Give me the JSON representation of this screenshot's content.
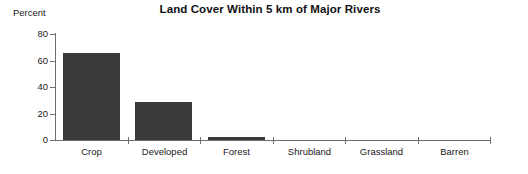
{
  "chart_data": {
    "type": "bar",
    "title": "Land Cover Within 5 km of Major Rivers",
    "xlabel": "",
    "ylabel": "Percent",
    "categories": [
      "Crop",
      "Developed",
      "Forest",
      "Shrubland",
      "Grassland",
      "Barren"
    ],
    "values": [
      66,
      28.5,
      2,
      0,
      0,
      0
    ],
    "ylim": [
      0,
      80
    ],
    "yticks": [
      0,
      20,
      40,
      60,
      80
    ],
    "ytick_labels": [
      "0",
      "20",
      "40",
      "60",
      "80"
    ],
    "grid": false,
    "legend": null,
    "series": [
      {
        "name": "Percent",
        "values": [
          66,
          28.5,
          2,
          0,
          0,
          0
        ],
        "color": "#3a3a3a"
      }
    ],
    "axis_color": "#6f6f6f",
    "background": "#ffffff"
  }
}
